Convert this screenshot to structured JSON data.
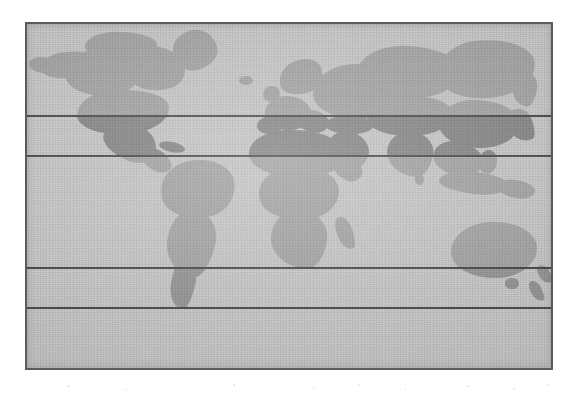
{
  "figure": {
    "kind": "world-map",
    "projection": "equirectangular",
    "frame": {
      "x": 25,
      "y": 22,
      "width": 528,
      "height": 348,
      "border_color": "#5a5a5a",
      "border_width_px": 2
    },
    "colors": {
      "page_background": "#ffffff",
      "ocean": "#cbcbcb",
      "land_default": "#a9a9a9",
      "land_highlight_north": "#8b8b8b",
      "land_highlight_south": "#9a9a9a",
      "latitude_line": "#4e4e4e"
    }
  },
  "latitude_lines": [
    {
      "id": "lat-line-1",
      "y": 91,
      "label": ""
    },
    {
      "id": "lat-line-2",
      "y": 131,
      "label": ""
    },
    {
      "id": "lat-line-3",
      "y": 243,
      "label": ""
    },
    {
      "id": "lat-line-4",
      "y": 283,
      "label": ""
    }
  ],
  "bands": [
    {
      "id": "band-north-polar",
      "top": 0,
      "height": 91,
      "shaded": false,
      "label": ""
    },
    {
      "id": "band-north-midlat",
      "top": 91,
      "height": 40,
      "shaded": true,
      "label": ""
    },
    {
      "id": "band-tropics",
      "top": 131,
      "height": 112,
      "shaded": false,
      "label": ""
    },
    {
      "id": "band-south-midlat",
      "top": 243,
      "height": 40,
      "shaded": true,
      "label": ""
    },
    {
      "id": "band-south-polar",
      "top": 283,
      "height": 61,
      "shaded": false,
      "label": ""
    }
  ],
  "landmasses": [
    {
      "name": "alaska",
      "x": 14,
      "y": 28,
      "w": 52,
      "h": 26,
      "r": "45% 55% 50% 60% / 55% 45% 60% 50%",
      "rot": -8
    },
    {
      "name": "alaska-west",
      "x": 2,
      "y": 33,
      "w": 26,
      "h": 16,
      "r": "60% 40% 50% 55% / 50% 60% 45% 55%",
      "rot": 6
    },
    {
      "name": "canada-west",
      "x": 38,
      "y": 24,
      "w": 78,
      "h": 48,
      "r": "48% 52% 46% 58% / 52% 44% 60% 50%",
      "rot": -4
    },
    {
      "name": "canada-arctic",
      "x": 58,
      "y": 8,
      "w": 72,
      "h": 28,
      "r": "50% 50% 45% 55% / 60% 40% 55% 45%",
      "rot": 3
    },
    {
      "name": "hudson-bay-land",
      "x": 96,
      "y": 22,
      "w": 62,
      "h": 44,
      "r": "46% 58% 52% 50% / 50% 55% 48% 58%",
      "rot": 5
    },
    {
      "name": "greenland",
      "x": 146,
      "y": 6,
      "w": 44,
      "h": 40,
      "r": "52% 48% 60% 44% / 48% 58% 42% 56%",
      "rot": -14
    },
    {
      "name": "usa-mainland",
      "x": 50,
      "y": 66,
      "w": 92,
      "h": 44,
      "r": "40% 55% 48% 52% / 55% 45% 55% 48%",
      "rot": -3
    },
    {
      "name": "mexico",
      "x": 76,
      "y": 100,
      "w": 54,
      "h": 36,
      "r": "55% 45% 40% 60% / 50% 55% 50% 45%",
      "rot": 22
    },
    {
      "name": "central-america",
      "x": 112,
      "y": 126,
      "w": 34,
      "h": 20,
      "r": "50% 50% 45% 55% / 55% 45% 55% 45%",
      "rot": 34
    },
    {
      "name": "caribbean",
      "x": 132,
      "y": 118,
      "w": 26,
      "h": 10,
      "r": "50%",
      "rot": 12
    },
    {
      "name": "south-america-n",
      "x": 134,
      "y": 136,
      "w": 74,
      "h": 58,
      "r": "48% 52% 46% 56% / 52% 48% 56% 46%",
      "rot": -6
    },
    {
      "name": "south-america-s",
      "x": 140,
      "y": 186,
      "w": 48,
      "h": 66,
      "r": "46% 54% 32% 66% / 48% 44% 60% 54%",
      "rot": 12
    },
    {
      "name": "patagonia",
      "x": 144,
      "y": 236,
      "w": 24,
      "h": 48,
      "r": "40% 60% 25% 70% / 40% 50% 58% 60%",
      "rot": 14
    },
    {
      "name": "iceland",
      "x": 212,
      "y": 52,
      "w": 14,
      "h": 9,
      "r": "50%",
      "rot": 0
    },
    {
      "name": "scandinavia",
      "x": 252,
      "y": 36,
      "w": 44,
      "h": 34,
      "r": "52% 48% 44% 58% / 56% 44% 58% 42%",
      "rot": -18
    },
    {
      "name": "british-isles",
      "x": 236,
      "y": 62,
      "w": 17,
      "h": 16,
      "r": "50% 50% 42% 58% / 56% 44% 56% 44%",
      "rot": -10
    },
    {
      "name": "europe-west",
      "x": 238,
      "y": 72,
      "w": 46,
      "h": 34,
      "r": "48% 52% 50% 50% / 52% 48% 52% 48%",
      "rot": 4
    },
    {
      "name": "iberia",
      "x": 230,
      "y": 92,
      "w": 26,
      "h": 18,
      "r": "50%",
      "rot": -6
    },
    {
      "name": "italy-balkans",
      "x": 268,
      "y": 86,
      "w": 34,
      "h": 22,
      "r": "48% 52% 46% 56% / 54% 46% 54% 46%",
      "rot": 14
    },
    {
      "name": "russia-europe",
      "x": 286,
      "y": 40,
      "w": 88,
      "h": 54,
      "r": "46% 54% 50% 52% / 54% 46% 52% 48%",
      "rot": -3
    },
    {
      "name": "siberia-west",
      "x": 330,
      "y": 22,
      "w": 102,
      "h": 52,
      "r": "48% 52% 46% 56% / 56% 44% 56% 44%",
      "rot": 2
    },
    {
      "name": "siberia-east",
      "x": 412,
      "y": 16,
      "w": 96,
      "h": 58,
      "r": "46% 58% 50% 50% / 52% 48% 58% 44%",
      "rot": -4
    },
    {
      "name": "kamchatka",
      "x": 486,
      "y": 48,
      "w": 24,
      "h": 34,
      "r": "44% 56% 34% 66% / 50% 44% 60% 52%",
      "rot": 8
    },
    {
      "name": "turkey-caucasus",
      "x": 298,
      "y": 92,
      "w": 48,
      "h": 18,
      "r": "50%",
      "rot": 2
    },
    {
      "name": "central-asia",
      "x": 340,
      "y": 72,
      "w": 86,
      "h": 40,
      "r": "48% 52% 48% 54% / 52% 48% 54% 48%",
      "rot": -2
    },
    {
      "name": "china-mongolia",
      "x": 412,
      "y": 76,
      "w": 80,
      "h": 48,
      "r": "46% 54% 50% 52% / 52% 48% 54% 48%",
      "rot": 2
    },
    {
      "name": "korea-japan",
      "x": 482,
      "y": 84,
      "w": 24,
      "h": 34,
      "r": "40% 60% 30% 70% / 48% 42% 62% 54%",
      "rot": -22
    },
    {
      "name": "arabia",
      "x": 300,
      "y": 108,
      "w": 42,
      "h": 36,
      "r": "48% 52% 42% 58% / 50% 50% 52% 48%",
      "rot": 18
    },
    {
      "name": "india",
      "x": 360,
      "y": 108,
      "w": 46,
      "h": 44,
      "r": "50% 50% 34% 66% / 48% 44% 60% 56%",
      "rot": 6
    },
    {
      "name": "southeast-asia",
      "x": 406,
      "y": 118,
      "w": 50,
      "h": 34,
      "r": "48% 52% 42% 58% / 52% 46% 56% 48%",
      "rot": 14
    },
    {
      "name": "indonesia",
      "x": 412,
      "y": 148,
      "w": 70,
      "h": 22,
      "r": "50% 50% 46% 54% / 56% 44% 56% 44%",
      "rot": 6
    },
    {
      "name": "new-guinea",
      "x": 470,
      "y": 156,
      "w": 38,
      "h": 18,
      "r": "50% 50% 44% 56% / 56% 44% 56% 44%",
      "rot": 10
    },
    {
      "name": "philippines",
      "x": 452,
      "y": 126,
      "w": 18,
      "h": 24,
      "r": "50%",
      "rot": 10
    },
    {
      "name": "africa-north",
      "x": 222,
      "y": 106,
      "w": 96,
      "h": 48,
      "r": "46% 54% 50% 52% / 52% 48% 52% 48%",
      "rot": 2
    },
    {
      "name": "africa-central",
      "x": 232,
      "y": 142,
      "w": 80,
      "h": 54,
      "r": "48% 52% 46% 56% / 50% 50% 54% 48%",
      "rot": -2
    },
    {
      "name": "africa-south",
      "x": 244,
      "y": 186,
      "w": 56,
      "h": 58,
      "r": "48% 52% 34% 66% / 50% 46% 58% 52%",
      "rot": 6
    },
    {
      "name": "madagascar",
      "x": 310,
      "y": 192,
      "w": 16,
      "h": 34,
      "r": "45% 55% 35% 65% / 50% 45% 58% 52%",
      "rot": -20
    },
    {
      "name": "horn-of-africa",
      "x": 306,
      "y": 134,
      "w": 30,
      "h": 22,
      "r": "50% 50% 40% 60% / 52% 48% 54% 46%",
      "rot": 26
    },
    {
      "name": "australia",
      "x": 424,
      "y": 198,
      "w": 86,
      "h": 56,
      "r": "48% 52% 48% 54% / 52% 48% 52% 48%",
      "rot": -2
    },
    {
      "name": "tasmania",
      "x": 478,
      "y": 254,
      "w": 14,
      "h": 11,
      "r": "50%",
      "rot": 0
    },
    {
      "name": "new-zealand-n",
      "x": 512,
      "y": 240,
      "w": 11,
      "h": 20,
      "r": "42% 58% 32% 68% / 48% 44% 60% 54%",
      "rot": -30
    },
    {
      "name": "new-zealand-s",
      "x": 504,
      "y": 256,
      "w": 11,
      "h": 22,
      "r": "42% 58% 32% 68% / 48% 44% 60% 54%",
      "rot": -28
    },
    {
      "name": "sri-lanka",
      "x": 388,
      "y": 150,
      "w": 9,
      "h": 11,
      "r": "50%",
      "rot": 0
    },
    {
      "name": "caspian-sea-land",
      "x": 318,
      "y": 84,
      "w": 22,
      "h": 16,
      "r": "50%",
      "rot": 0
    }
  ]
}
